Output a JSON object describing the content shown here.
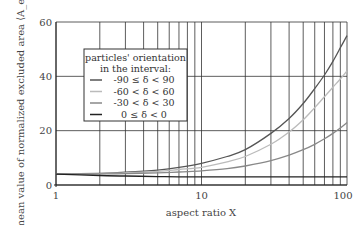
{
  "chart_data": {
    "type": "line",
    "title": "",
    "xlabel": "aspect ratio X",
    "ylabel": "mean value of normalized excluded area ⟨A_ex/A⟩",
    "xscale": "log",
    "xlim": [
      1,
      100
    ],
    "ylim": [
      0,
      60
    ],
    "xticks": [
      1,
      10,
      100
    ],
    "xtick_labels": [
      "1",
      "10",
      "100"
    ],
    "yticks": [
      0,
      20,
      40,
      60
    ],
    "ytick_labels": [
      "0",
      "20",
      "40",
      "60"
    ],
    "grid": true,
    "legend": {
      "title_line1": "particles' orientation",
      "title_line2": "in the interval:",
      "position": "upper left (inside)"
    },
    "x": [
      1,
      2,
      3,
      5,
      7,
      10,
      15,
      20,
      30,
      40,
      50,
      60,
      70,
      80,
      90,
      100
    ],
    "series": [
      {
        "name": "-90 ≤ δ < 90",
        "color": "#555555",
        "values": [
          4.0,
          4.3,
          4.7,
          5.5,
          6.5,
          8.0,
          10.5,
          13.0,
          19.0,
          24.5,
          30.0,
          35.5,
          40.5,
          45.5,
          50.5,
          55.0
        ]
      },
      {
        "name": "-60 < δ < 60",
        "color": "#bbbbbb",
        "values": [
          4.0,
          4.2,
          4.5,
          5.0,
          5.7,
          6.5,
          8.5,
          10.5,
          15.0,
          19.5,
          24.0,
          28.5,
          32.5,
          36.0,
          39.0,
          42.0
        ]
      },
      {
        "name": "-30 < δ < 30",
        "color": "#888888",
        "values": [
          4.0,
          4.1,
          4.2,
          4.5,
          4.8,
          5.2,
          6.0,
          7.0,
          9.0,
          11.0,
          13.0,
          15.0,
          17.0,
          19.0,
          21.0,
          23.0
        ]
      },
      {
        "name": "0 ≤ δ < 0",
        "color": "#222222",
        "values": [
          4.0,
          3.5,
          3.3,
          3.1,
          3.0,
          3.0,
          3.0,
          3.0,
          3.0,
          3.0,
          3.0,
          3.0,
          3.0,
          3.0,
          3.0,
          3.0
        ]
      }
    ]
  }
}
